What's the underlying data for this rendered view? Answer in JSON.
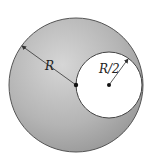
{
  "diagram": {
    "outer_circle": {
      "cx": 76,
      "cy": 85,
      "r": 67,
      "fill_light": "#cfcfcf",
      "fill_dark": "#9a9a9a",
      "stroke": "#555555"
    },
    "inner_circle": {
      "cx": 109,
      "cy": 85,
      "r": 33,
      "fill": "#ffffff",
      "stroke": "#444444"
    },
    "labels": {
      "outer_radius": "R",
      "inner_radius": "R/2"
    },
    "colors": {
      "line": "#333333",
      "dot": "#111111"
    }
  }
}
